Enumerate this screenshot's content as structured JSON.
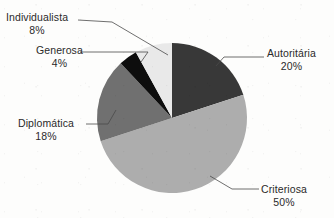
{
  "chart_data": {
    "type": "pie",
    "title": "",
    "subtitle": "",
    "xlabel": "",
    "ylabel": "",
    "legend_position": "outside-labels-with-leader-lines",
    "grid": false,
    "value_unit": "%",
    "categories": [
      "Autoritária",
      "Criteriosa",
      "Diplomática",
      "Generosa",
      "Individualista"
    ],
    "values": [
      20,
      50,
      18,
      4,
      8
    ],
    "slices": [
      {
        "label": "Autoritária",
        "value": 20,
        "value_label": "20%",
        "color": "#383838",
        "start_angle_deg": 0,
        "end_angle_deg": 72,
        "label_side": "right"
      },
      {
        "label": "Criteriosa",
        "value": 50,
        "value_label": "50%",
        "color": "#adadad",
        "start_angle_deg": 72,
        "end_angle_deg": 252,
        "label_side": "right"
      },
      {
        "label": "Diplomática",
        "value": 18,
        "value_label": "18%",
        "color": "#707070",
        "start_angle_deg": 252,
        "end_angle_deg": 316.8,
        "label_side": "left"
      },
      {
        "label": "Generosa",
        "value": 4,
        "value_label": "4%",
        "color": "#0d0d0d",
        "start_angle_deg": 316.8,
        "end_angle_deg": 331.2,
        "label_side": "left"
      },
      {
        "label": "Individualista",
        "value": 8,
        "value_label": "8%",
        "color": "#e9e9e9",
        "start_angle_deg": 331.2,
        "end_angle_deg": 360,
        "label_side": "left"
      }
    ],
    "background_color": "#fdfdfc",
    "leader_line_color": "#4a4a4a"
  },
  "labels": {
    "individualista": {
      "name": "Individualista",
      "percent": "8%"
    },
    "generosa": {
      "name": "Generosa",
      "percent": "4%"
    },
    "diplomatica": {
      "name": "Diplomática",
      "percent": "18%"
    },
    "autoritaria": {
      "name": "Autoritária",
      "percent": "20%"
    },
    "criteriosa": {
      "name": "Criteriosa",
      "percent": "50%"
    }
  }
}
